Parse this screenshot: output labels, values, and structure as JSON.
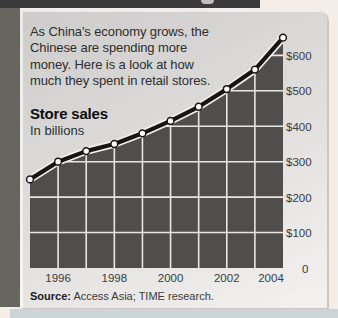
{
  "page": {
    "intro_lines": [
      "As China's economy grows, the",
      "Chinese are spending more",
      "money. Here is a look at how",
      "much they spent in retail stores."
    ],
    "source_bold": "Source:",
    "source_rest": " Access Asia; TIME research."
  },
  "colors": {
    "page_background": "#f5ede7",
    "top_bar": "#3a3a3c",
    "left_strip": "#67665e",
    "bottom_strip": "#cbd5d9",
    "card_background_top": "#cdcccb",
    "card_background_bottom": "#f3f2f0"
  },
  "chart_data": {
    "type": "area",
    "title": "Store sales",
    "subtitle": "In billions",
    "x": [
      1995,
      1996,
      1997,
      1998,
      1999,
      2000,
      2001,
      2002,
      2003,
      2004
    ],
    "values": [
      250,
      300,
      330,
      350,
      380,
      415,
      455,
      505,
      560,
      650
    ],
    "xlim": [
      1995,
      2004
    ],
    "ylim": [
      0,
      666
    ],
    "x_ticks": [
      1996,
      1998,
      2000,
      2002,
      2004
    ],
    "x_tick_labels": [
      "1996",
      "1998",
      "2000",
      "2002",
      "2004"
    ],
    "y_ticks": [
      600,
      500,
      400,
      300,
      200,
      100,
      0
    ],
    "y_tick_labels": [
      "$600",
      "$500",
      "$400",
      "$300",
      "$200",
      "$100",
      "0"
    ],
    "grid": true,
    "legend": "none",
    "area_color": "#4f4e4c",
    "line_color": "#161616",
    "grid_color": "#e8e7e5",
    "marker_fill": "#ffffff",
    "marker_stroke": "#161616"
  }
}
